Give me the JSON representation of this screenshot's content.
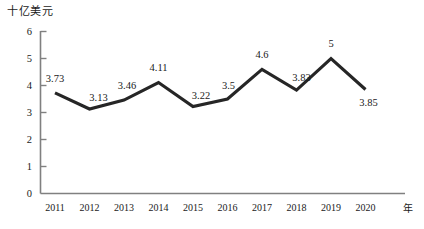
{
  "chart_data": {
    "type": "line",
    "title": "",
    "ylabel": "十亿美元",
    "xlabel": "年",
    "categories": [
      "2011",
      "2012",
      "2013",
      "2014",
      "2015",
      "2016",
      "2017",
      "2018",
      "2019",
      "2020"
    ],
    "values": [
      3.73,
      3.13,
      3.46,
      4.11,
      3.22,
      3.5,
      4.6,
      3.83,
      5,
      3.85
    ],
    "point_labels": [
      "3.73",
      "3.13",
      "3.46",
      "4.11",
      "3.22",
      "3.5",
      "4.6",
      "3.83",
      "5",
      "3.85"
    ],
    "ylim": [
      0,
      6
    ],
    "yticks": [
      0,
      1,
      2,
      3,
      4,
      5,
      6
    ],
    "ytick_labels": [
      "0",
      "1",
      "2",
      "3",
      "4",
      "5",
      "6"
    ],
    "grid": false,
    "legend": "none",
    "series": [
      {
        "name": "十亿美元",
        "values": [
          3.73,
          3.13,
          3.46,
          4.11,
          3.22,
          3.5,
          4.6,
          3.83,
          5,
          3.85
        ],
        "color": "#262626"
      }
    ]
  },
  "colors": {
    "line": "#262626",
    "axis": "#808080",
    "text": "#1a1a1a",
    "background": "#ffffff"
  }
}
